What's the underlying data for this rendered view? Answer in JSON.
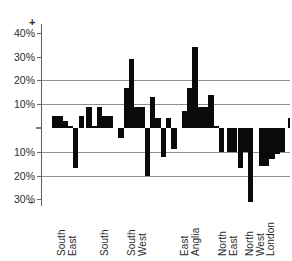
{
  "chart": {
    "type": "bar",
    "title": "",
    "axis": {
      "plus_sign": "+",
      "minus_sign": "-",
      "zero_label": ""
    }
  },
  "chart_data": {
    "type": "bar",
    "title": "",
    "subtitle": "",
    "xlabel": "",
    "ylabel": "",
    "ylim": [
      -35,
      45
    ],
    "ytick_values": [
      40,
      30,
      20,
      10,
      0,
      -10,
      -20,
      -30
    ],
    "ytick_labels": [
      "40%",
      "30%",
      "20%",
      "10%",
      "",
      "10%",
      "20%",
      "30%"
    ],
    "axis_end_labels": {
      "top": "+",
      "bottom": "-"
    },
    "gridlines": [
      20,
      10,
      -10,
      -20
    ],
    "grid": true,
    "legend": "none",
    "orientation": "vertical",
    "bar_color": "#0a0a0a",
    "categories": [
      "South East",
      "South",
      "South West",
      "East Anglia",
      "North East",
      "North West",
      "London"
    ],
    "category_labels_rotated": true,
    "series": [
      {
        "name": "percentage change",
        "groups": [
          {
            "category": "South East",
            "values": [
              5,
              5,
              3,
              1,
              -17,
              5
            ]
          },
          {
            "category": "South",
            "values": [
              9,
              1,
              9,
              5,
              5
            ]
          },
          {
            "category": "South West",
            "values": [
              -4,
              17,
              29,
              9,
              9,
              -20,
              1
            ]
          },
          {
            "category": "South West / East Anglia",
            "values": [
              13,
              4,
              -12,
              4,
              -9
            ]
          },
          {
            "category": "East Anglia",
            "values": [
              7,
              17,
              34,
              9,
              9,
              1,
              -1
            ]
          },
          {
            "category": "East Anglia / North East",
            "values": [
              14,
              1,
              -10
            ]
          },
          {
            "category": "North East",
            "values": [
              -10,
              -10,
              -17,
              -10,
              -31
            ]
          },
          {
            "category": "North West",
            "values": [
              -16,
              -16,
              -13,
              -11,
              -10,
              -9
            ]
          },
          {
            "category": "London",
            "values": [
              4
            ]
          }
        ]
      }
    ],
    "bars": [
      {
        "x": 0.0,
        "value": 5,
        "group": "South East"
      },
      {
        "x": 1.0,
        "value": 5,
        "group": "South East"
      },
      {
        "x": 2.0,
        "value": 3,
        "group": "South East"
      },
      {
        "x": 3.0,
        "value": 1,
        "group": "South East"
      },
      {
        "x": 4.0,
        "value": -17,
        "group": "South East"
      },
      {
        "x": 5.0,
        "value": 5,
        "group": "South East"
      },
      {
        "x": 6.5,
        "value": 9,
        "group": "South"
      },
      {
        "x": 7.5,
        "value": 1,
        "group": "South"
      },
      {
        "x": 8.5,
        "value": 9,
        "group": "South"
      },
      {
        "x": 9.5,
        "value": 5,
        "group": "South"
      },
      {
        "x": 10.5,
        "value": 5,
        "group": "South"
      },
      {
        "x": 12.5,
        "value": -4,
        "group": "South West"
      },
      {
        "x": 13.5,
        "value": 17,
        "group": "South West"
      },
      {
        "x": 14.5,
        "value": 29,
        "group": "South West"
      },
      {
        "x": 15.5,
        "value": 9,
        "group": "South West"
      },
      {
        "x": 16.5,
        "value": 9,
        "group": "South West"
      },
      {
        "x": 17.5,
        "value": -20,
        "group": "South West"
      },
      {
        "x": 18.5,
        "value": 13,
        "group": "South West"
      },
      {
        "x": 19.5,
        "value": 4,
        "group": "South West"
      },
      {
        "x": 20.5,
        "value": -12,
        "group": "South West"
      },
      {
        "x": 21.5,
        "value": 4,
        "group": "South West"
      },
      {
        "x": 22.5,
        "value": -9,
        "group": "South West"
      },
      {
        "x": 24.5,
        "value": 7,
        "group": "East Anglia"
      },
      {
        "x": 25.5,
        "value": 17,
        "group": "East Anglia"
      },
      {
        "x": 26.5,
        "value": 34,
        "group": "East Anglia"
      },
      {
        "x": 27.5,
        "value": 9,
        "group": "East Anglia"
      },
      {
        "x": 28.5,
        "value": 9,
        "group": "East Anglia"
      },
      {
        "x": 29.5,
        "value": 14,
        "group": "East Anglia"
      },
      {
        "x": 30.5,
        "value": 1,
        "group": "East Anglia"
      },
      {
        "x": 31.5,
        "value": -10,
        "group": "East Anglia"
      },
      {
        "x": 33.0,
        "value": -10,
        "group": "North East"
      },
      {
        "x": 34.0,
        "value": -10,
        "group": "North East"
      },
      {
        "x": 35.0,
        "value": -17,
        "group": "North East"
      },
      {
        "x": 36.0,
        "value": -10,
        "group": "North East"
      },
      {
        "x": 37.0,
        "value": -31,
        "group": "North East"
      },
      {
        "x": 39.0,
        "value": -16,
        "group": "North West"
      },
      {
        "x": 40.0,
        "value": -16,
        "group": "North West"
      },
      {
        "x": 41.0,
        "value": -13,
        "group": "North West"
      },
      {
        "x": 42.0,
        "value": -11,
        "group": "North West"
      },
      {
        "x": 43.0,
        "value": -10,
        "group": "North West"
      },
      {
        "x": 44.5,
        "value": 4,
        "group": "London"
      }
    ]
  },
  "ticks": [
    {
      "label": "40%",
      "value": 40
    },
    {
      "label": "30%",
      "value": 30
    },
    {
      "label": "20%",
      "value": 20
    },
    {
      "label": "10%",
      "value": 10
    },
    {
      "label": "10%",
      "value": -10
    },
    {
      "label": "20%",
      "value": -20
    },
    {
      "label": "30%",
      "value": -30
    }
  ],
  "categories": [
    {
      "name": "south-east",
      "lines": [
        "South",
        "East"
      ]
    },
    {
      "name": "south",
      "lines": [
        "South"
      ]
    },
    {
      "name": "south-west",
      "lines": [
        "South",
        "West"
      ]
    },
    {
      "name": "east-anglia",
      "lines": [
        "East",
        "Anglia"
      ]
    },
    {
      "name": "north-east",
      "lines": [
        "North",
        "East"
      ]
    },
    {
      "name": "north-west",
      "lines": [
        "North",
        "West"
      ]
    },
    {
      "name": "london",
      "lines": [
        "London"
      ]
    }
  ]
}
